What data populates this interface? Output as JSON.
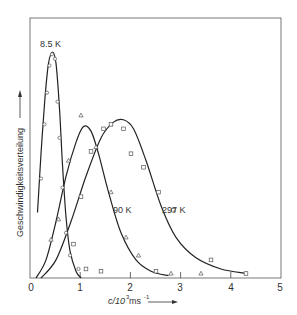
{
  "chart_data": {
    "type": "line",
    "title": "",
    "xlabel": "c/10³ ms⁻¹",
    "ylabel": "Geschwindigkeitsverteilung",
    "xlim": [
      0,
      5
    ],
    "ylim": [
      0,
      1
    ],
    "x_ticks": [
      "0",
      "1",
      "2",
      "3",
      "4",
      "5"
    ],
    "grid": false,
    "legend": "curve labels placed near curves",
    "series": [
      {
        "name": "8.5 K",
        "label": "8.5 K",
        "marker": "circle",
        "curve": [
          [
            0.13,
            0.29
          ],
          [
            0.2,
            0.55
          ],
          [
            0.28,
            0.8
          ],
          [
            0.35,
            0.95
          ],
          [
            0.43,
            1.0
          ],
          [
            0.5,
            0.95
          ],
          [
            0.57,
            0.75
          ],
          [
            0.63,
            0.5
          ],
          [
            0.7,
            0.27
          ],
          [
            0.78,
            0.12
          ],
          [
            0.9,
            0.03
          ],
          [
            1.0,
            0.0
          ]
        ],
        "points": [
          [
            0.2,
            0.44
          ],
          [
            0.27,
            0.68
          ],
          [
            0.32,
            0.82
          ],
          [
            0.37,
            0.94
          ],
          [
            0.42,
            0.99
          ],
          [
            0.48,
            0.97
          ],
          [
            0.53,
            0.78
          ],
          [
            0.57,
            0.62
          ],
          [
            0.63,
            0.4
          ],
          [
            0.7,
            0.2
          ],
          [
            0.78,
            0.1
          ],
          [
            0.95,
            0.04
          ]
        ]
      },
      {
        "name": "90 K",
        "label": "90 K",
        "marker": "triangle",
        "curve": [
          [
            0.1,
            0.0
          ],
          [
            0.3,
            0.08
          ],
          [
            0.5,
            0.25
          ],
          [
            0.7,
            0.45
          ],
          [
            0.9,
            0.6
          ],
          [
            1.05,
            0.67
          ],
          [
            1.2,
            0.65
          ],
          [
            1.35,
            0.55
          ],
          [
            1.55,
            0.38
          ],
          [
            1.8,
            0.2
          ],
          [
            2.1,
            0.08
          ],
          [
            2.4,
            0.03
          ],
          [
            2.75,
            0.01
          ]
        ],
        "points": [
          [
            0.4,
            0.17
          ],
          [
            0.55,
            0.26
          ],
          [
            0.75,
            0.52
          ],
          [
            1.0,
            0.72
          ],
          [
            1.3,
            0.58
          ],
          [
            1.6,
            0.38
          ],
          [
            1.9,
            0.18
          ],
          [
            2.15,
            0.1
          ],
          [
            2.8,
            0.02
          ],
          [
            3.4,
            0.02
          ]
        ]
      },
      {
        "name": "297 K",
        "label": "297 K",
        "marker": "square",
        "curve": [
          [
            0.2,
            0.0
          ],
          [
            0.5,
            0.08
          ],
          [
            0.8,
            0.25
          ],
          [
            1.1,
            0.45
          ],
          [
            1.4,
            0.62
          ],
          [
            1.65,
            0.69
          ],
          [
            1.85,
            0.7
          ],
          [
            2.05,
            0.66
          ],
          [
            2.3,
            0.52
          ],
          [
            2.6,
            0.32
          ],
          [
            2.9,
            0.18
          ],
          [
            3.3,
            0.09
          ],
          [
            3.8,
            0.04
          ],
          [
            4.3,
            0.02
          ]
        ],
        "points": [
          [
            0.85,
            0.15
          ],
          [
            1.0,
            0.36
          ],
          [
            1.2,
            0.56
          ],
          [
            1.45,
            0.66
          ],
          [
            1.6,
            0.68
          ],
          [
            1.85,
            0.66
          ],
          [
            2.0,
            0.55
          ],
          [
            2.25,
            0.49
          ],
          [
            2.55,
            0.38
          ],
          [
            2.85,
            0.3
          ],
          [
            3.6,
            0.08
          ],
          [
            4.3,
            0.02
          ],
          [
            2.5,
            0.03
          ],
          [
            1.4,
            0.03
          ],
          [
            1.1,
            0.04
          ]
        ]
      }
    ]
  },
  "labels": {
    "ylabel": "Geschwindigkeitsverteilung",
    "xlabel_main": "c/10",
    "xlabel_sup": "3",
    "xlabel_unit": " ms",
    "xlabel_unit_sup": "-1",
    "series_85": "8.5 K",
    "series_90": "90 K",
    "series_297": "297 K",
    "tick_0": "0",
    "tick_1": "1",
    "tick_2": "2",
    "tick_3": "3",
    "tick_4": "4",
    "tick_5": "5"
  }
}
